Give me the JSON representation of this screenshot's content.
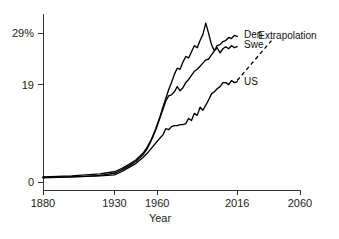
{
  "chart_data": {
    "type": "line",
    "title": "",
    "xlabel": "Year",
    "ylabel": "",
    "xlim": [
      1880,
      2060
    ],
    "ylim": [
      0,
      32
    ],
    "grid": false,
    "legend_position": "inline-right",
    "x_ticks": [
      1880,
      1930,
      1960,
      2016,
      2060
    ],
    "x_tick_labels": [
      "1880",
      "1930",
      "1960",
      "2016",
      "2060"
    ],
    "y_ticks": [
      0,
      19,
      29
    ],
    "y_tick_labels": [
      "0",
      "19",
      "29%"
    ],
    "annotations": [
      {
        "text": "Extrapolation",
        "x": 2035,
        "y": 28.5,
        "style": "dashed-line-callout"
      }
    ],
    "series": [
      {
        "name": "Den",
        "label": "Den",
        "color": "#000000",
        "style": "solid",
        "label_x": 2018,
        "label_y": 28.8,
        "x": [
          1880,
          1890,
          1900,
          1910,
          1920,
          1925,
          1930,
          1935,
          1940,
          1945,
          1950,
          1953,
          1956,
          1959,
          1962,
          1964,
          1966,
          1968,
          1970,
          1972,
          1974,
          1976,
          1978,
          1980,
          1982,
          1984,
          1986,
          1988,
          1990,
          1992,
          1994,
          1996,
          1998,
          2000,
          2002,
          2004,
          2006,
          2008,
          2010,
          2012,
          2014,
          2016
        ],
        "y": [
          1.0,
          1.1,
          1.2,
          1.4,
          1.6,
          1.8,
          2.0,
          2.6,
          3.4,
          4.3,
          5.6,
          6.8,
          8.4,
          10.4,
          12.8,
          14.6,
          16.3,
          18.0,
          19.4,
          21.0,
          22.2,
          22.0,
          23.4,
          24.5,
          24.2,
          25.4,
          26.6,
          26.2,
          27.6,
          28.8,
          31.0,
          29.0,
          26.8,
          25.6,
          26.6,
          26.8,
          27.4,
          27.6,
          28.2,
          28.0,
          28.6,
          28.4
        ]
      },
      {
        "name": "Swe",
        "label": "Swe",
        "color": "#000000",
        "style": "solid",
        "label_x": 2018,
        "label_y": 26.8,
        "x": [
          1880,
          1890,
          1900,
          1910,
          1920,
          1925,
          1930,
          1935,
          1940,
          1945,
          1950,
          1953,
          1956,
          1959,
          1962,
          1964,
          1966,
          1968,
          1970,
          1972,
          1974,
          1976,
          1978,
          1980,
          1982,
          1984,
          1986,
          1988,
          1990,
          1992,
          1994,
          1996,
          1998,
          2000,
          2002,
          2004,
          2006,
          2008,
          2010,
          2012,
          2014,
          2016
        ],
        "y": [
          0.8,
          0.9,
          1.0,
          1.1,
          1.3,
          1.5,
          1.7,
          2.3,
          3.1,
          4.0,
          5.3,
          6.5,
          8.2,
          10.2,
          12.6,
          14.2,
          15.8,
          16.8,
          17.0,
          17.6,
          18.6,
          17.8,
          18.4,
          19.4,
          20.0,
          20.8,
          21.6,
          22.0,
          22.6,
          23.2,
          23.8,
          24.0,
          24.8,
          25.6,
          26.2,
          25.2,
          26.0,
          26.4,
          26.0,
          26.6,
          26.2,
          26.4
        ]
      },
      {
        "name": "US",
        "label": "US",
        "color": "#000000",
        "style": "solid",
        "label_x": 2018,
        "label_y": 19.6,
        "x": [
          1880,
          1890,
          1900,
          1910,
          1920,
          1925,
          1930,
          1935,
          1940,
          1945,
          1950,
          1953,
          1956,
          1959,
          1962,
          1964,
          1966,
          1968,
          1970,
          1972,
          1974,
          1976,
          1978,
          1980,
          1982,
          1984,
          1986,
          1988,
          1990,
          1992,
          1994,
          1996,
          1998,
          2000,
          2002,
          2004,
          2006,
          2008,
          2010,
          2012,
          2014,
          2016
        ],
        "y": [
          0.9,
          0.9,
          1.0,
          1.1,
          1.2,
          1.3,
          1.4,
          2.0,
          2.8,
          3.6,
          4.8,
          5.6,
          6.6,
          7.6,
          8.6,
          9.2,
          10.4,
          10.2,
          10.8,
          11.0,
          11.0,
          11.2,
          11.2,
          11.4,
          12.4,
          12.0,
          13.4,
          13.0,
          14.6,
          14.0,
          15.0,
          16.0,
          17.2,
          17.6,
          18.2,
          18.6,
          19.4,
          19.4,
          19.0,
          19.8,
          19.4,
          19.6
        ]
      }
    ],
    "extrapolation": {
      "name": "Extrapolation",
      "style": "dashed",
      "x": [
        2016,
        2040
      ],
      "y": [
        19.8,
        27.6
      ]
    }
  }
}
